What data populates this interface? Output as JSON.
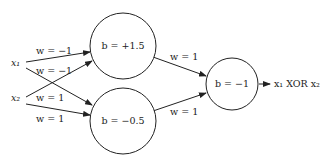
{
  "diagram": {
    "inputs": [
      {
        "id": "x1",
        "label": "x₁"
      },
      {
        "id": "x2",
        "label": "x₂"
      }
    ],
    "hidden_nodes": [
      {
        "id": "h1",
        "label": "b = +1.5"
      },
      {
        "id": "h2",
        "label": "b = −0.5"
      }
    ],
    "output_node": {
      "id": "out",
      "label": "b = −1"
    },
    "output_label": "x₁ XOR x₂",
    "edges": [
      {
        "from": "x1",
        "to": "h1",
        "label": "w = −1"
      },
      {
        "from": "x2",
        "to": "h1",
        "label": "w = −1"
      },
      {
        "from": "x1",
        "to": "h2",
        "label": "w = 1"
      },
      {
        "from": "x2",
        "to": "h2",
        "label": "w = 1"
      },
      {
        "from": "h1",
        "to": "out",
        "label": "w = 1"
      },
      {
        "from": "h2",
        "to": "out",
        "label": "w = 1"
      }
    ]
  }
}
